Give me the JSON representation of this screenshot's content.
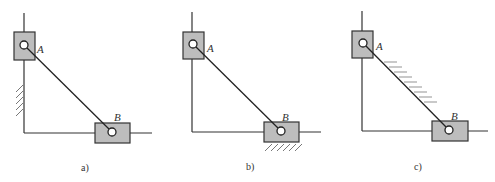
{
  "diagrams": [
    {
      "id": "a",
      "caption": "a)",
      "point_a": "A",
      "point_b": "B",
      "hatch": "vertical-wall-left"
    },
    {
      "id": "b",
      "caption": "b)",
      "point_a": "A",
      "point_b": "B",
      "hatch": "under-slider-b"
    },
    {
      "id": "c",
      "caption": "c)",
      "point_a": "A",
      "point_b": "B",
      "hatch": "along-rod-ab"
    }
  ],
  "colors": {
    "line": "#333333",
    "slider_fill": "#bdbdbd",
    "background": "#ffffff"
  }
}
